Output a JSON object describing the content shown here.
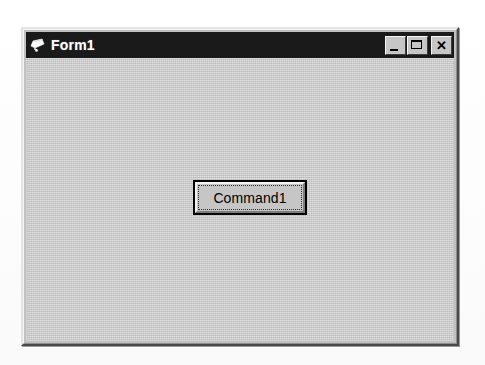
{
  "window": {
    "title": "Form1",
    "icon": "vb-form-icon",
    "titlebar_color": "#1a1a1a",
    "title_text_color": "#ffffff",
    "client_color": "#c3c3c3",
    "controls": [
      {
        "name": "minimize",
        "label": "",
        "glyph": "minimize-icon"
      },
      {
        "name": "maximize",
        "label": "",
        "glyph": "maximize-icon"
      },
      {
        "name": "close",
        "label": "✕",
        "glyph": "close-icon"
      }
    ]
  },
  "form": {
    "command_button": {
      "label": "Command1",
      "focused": true
    }
  }
}
